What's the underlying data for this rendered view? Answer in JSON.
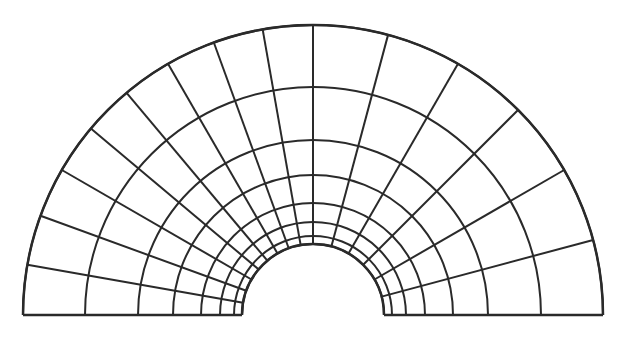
{
  "diagram": {
    "type": "polar-mesh-half-annulus",
    "canvas": {
      "width": 631,
      "height": 337,
      "background": "#ffffff"
    },
    "center": {
      "x": 313,
      "y": 315
    },
    "stroke": {
      "color": "#2a2a2a",
      "width": 2
    },
    "ring_radii": [
      71,
      79,
      93,
      112,
      140,
      175,
      228,
      290
    ],
    "left_half": {
      "angle_start_deg": 90,
      "angle_end_deg": 180,
      "spoke_step_deg": 10,
      "spoke_angles_deg": [
        90,
        100,
        110,
        120,
        130,
        140,
        150,
        160,
        170,
        180
      ]
    },
    "right_half": {
      "angle_start_deg": 0,
      "angle_end_deg": 90,
      "spoke_step_deg": 15,
      "spoke_angles_deg": [
        0,
        15,
        30,
        45,
        60,
        75,
        90
      ]
    }
  }
}
